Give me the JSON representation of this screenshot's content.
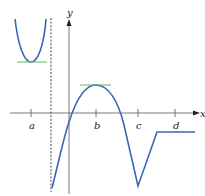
{
  "figure": {
    "type": "function-graph",
    "axes": {
      "x_label": "x",
      "y_label": "y"
    },
    "tick_labels": [
      "a",
      "b",
      "c",
      "d"
    ],
    "features": {
      "vertical_asymptote": "dashed line between a and y-axis",
      "local_min_tangent": "horizontal tangent at x = a",
      "local_max_tangent": "horizontal tangent at x = b",
      "corner": "sharp minimum at x = c",
      "constant_segment": "horizontal segment after c, through d"
    },
    "colors": {
      "curve": "#3a66b5",
      "tangent": "#5cb85c",
      "axes": "#555555",
      "asymptote": "#333333"
    }
  }
}
